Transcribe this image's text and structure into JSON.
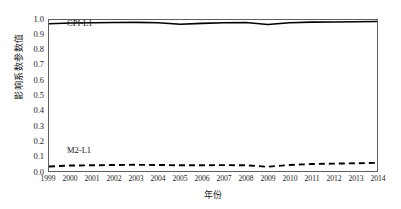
{
  "chart_data": {
    "type": "line",
    "title": "",
    "xlabel": "年份",
    "ylabel": "影响系数参数值",
    "xlim": [
      1999,
      2014
    ],
    "ylim": [
      0.0,
      1.0
    ],
    "grid": false,
    "legend_position": "inline-labels",
    "x": [
      1999,
      2000,
      2001,
      2002,
      2003,
      2004,
      2005,
      2006,
      2007,
      2008,
      2009,
      2010,
      2011,
      2012,
      2013,
      2014
    ],
    "categories": [
      "1999",
      "2000",
      "2001",
      "2002",
      "2003",
      "2004",
      "2005",
      "2006",
      "2007",
      "2008",
      "2009",
      "2010",
      "2011",
      "2012",
      "2013",
      "2014"
    ],
    "y_ticks": [
      "1.0",
      "0.9",
      "0.8",
      "0.7",
      "0.6",
      "0.5",
      "0.4",
      "0.3",
      "0.2",
      "0.1",
      "0.0"
    ],
    "y_tick_values": [
      1.0,
      0.9,
      0.8,
      0.7,
      0.6,
      0.5,
      0.4,
      0.3,
      0.2,
      0.1,
      0.0
    ],
    "series": [
      {
        "name": "CPI-L1",
        "style": "solid",
        "color": "#000000",
        "values": [
          0.975,
          0.98,
          0.982,
          0.983,
          0.984,
          0.982,
          0.972,
          0.978,
          0.982,
          0.983,
          0.97,
          0.982,
          0.986,
          0.987,
          0.988,
          0.99
        ]
      },
      {
        "name": "M2-L1",
        "style": "dashed",
        "color": "#000000",
        "values": [
          0.03,
          0.036,
          0.038,
          0.04,
          0.041,
          0.04,
          0.038,
          0.038,
          0.039,
          0.038,
          0.028,
          0.04,
          0.046,
          0.049,
          0.051,
          0.054
        ]
      }
    ]
  },
  "labels": {
    "series_cpi": "CPI-L1",
    "series_m2": "M2-L1",
    "y_axis_title": "影响系数参数值",
    "x_axis_title": "年份"
  }
}
